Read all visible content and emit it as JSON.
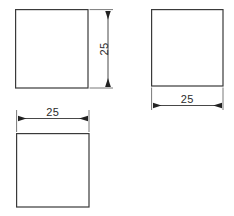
{
  "drawing": {
    "title": "Orthographic views of a cube",
    "canvas": {
      "width": 234,
      "height": 216,
      "background": "#ffffff"
    },
    "style": {
      "outline_color": "#3a3a3a",
      "dimension_color": "#333333",
      "extension_color": "#555555",
      "text_color": "#2b2b2b",
      "fill_color": "#ffffff"
    },
    "views": [
      {
        "name": "front-view",
        "shape": "square",
        "x": 15,
        "y": 9,
        "width": 73,
        "height": 79,
        "dimension": {
          "label": "25",
          "orientation": "vertical",
          "side": "right"
        }
      },
      {
        "name": "side-view",
        "shape": "square",
        "x": 151,
        "y": 9,
        "width": 72,
        "height": 77,
        "dimension": {
          "label": "25",
          "orientation": "horizontal",
          "side": "bottom"
        }
      },
      {
        "name": "top-view",
        "shape": "square",
        "x": 16,
        "y": 133,
        "width": 73,
        "height": 74,
        "dimension": {
          "label": "25",
          "orientation": "horizontal",
          "side": "top"
        }
      }
    ],
    "dimensions": [
      {
        "name": "front-view-height",
        "value": "25",
        "orientation": "vertical"
      },
      {
        "name": "side-view-width",
        "value": "25",
        "orientation": "horizontal"
      },
      {
        "name": "top-view-width",
        "value": "25",
        "orientation": "horizontal"
      }
    ]
  }
}
